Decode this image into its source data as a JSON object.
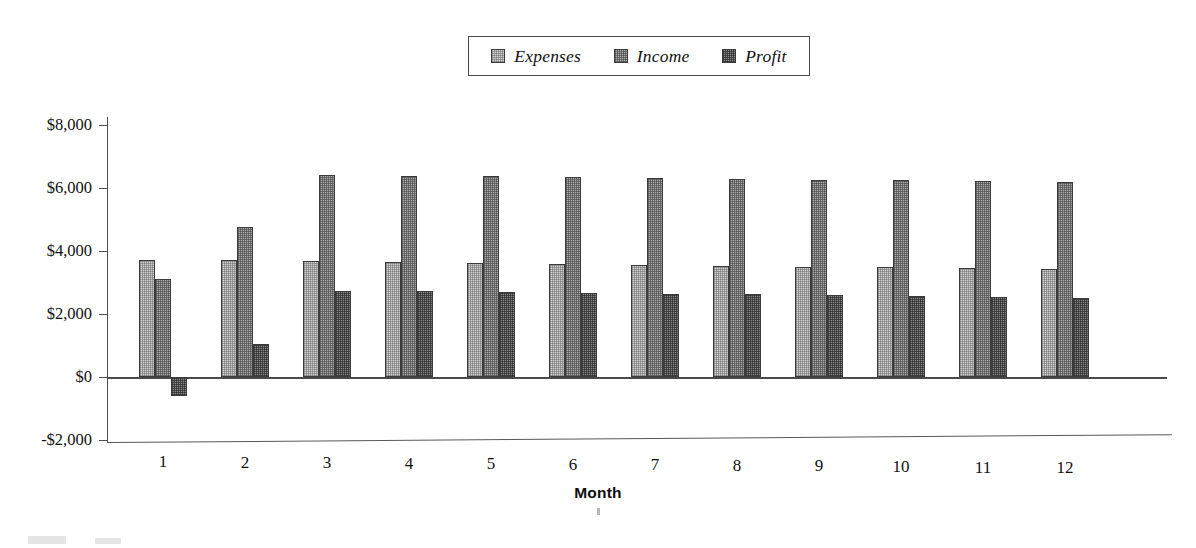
{
  "chart_data": {
    "type": "bar",
    "title": "",
    "subtitle": "",
    "xlabel": "Month",
    "ylabel": "",
    "categories": [
      "1",
      "2",
      "3",
      "4",
      "5",
      "6",
      "7",
      "8",
      "9",
      "10",
      "11",
      "12"
    ],
    "ylim": [
      -2000,
      8000
    ],
    "ytick_values": [
      8000,
      6000,
      4000,
      2000,
      0,
      -2000
    ],
    "ytick_labels": [
      "$8,000",
      "$6,000",
      "$4,000",
      "$2,000",
      "$0",
      "-$2,000"
    ],
    "grid": false,
    "legend_position": "top-center",
    "series": [
      {
        "name": "Expenses",
        "color": "#d2d2d2",
        "values": [
          3700,
          3700,
          3680,
          3640,
          3620,
          3590,
          3560,
          3530,
          3500,
          3480,
          3460,
          3440
        ]
      },
      {
        "name": "Income",
        "color": "#ababab",
        "values": [
          3100,
          4750,
          6400,
          6390,
          6370,
          6340,
          6320,
          6290,
          6260,
          6240,
          6210,
          6190
        ]
      },
      {
        "name": "Profit",
        "color": "#8a8a8a",
        "values": [
          -600,
          1050,
          2740,
          2720,
          2700,
          2670,
          2650,
          2620,
          2590,
          2570,
          2540,
          2520
        ]
      }
    ]
  },
  "legend": {
    "items": [
      {
        "label": "Expenses",
        "swatch": "legend-swatch-expenses"
      },
      {
        "label": "Income",
        "swatch": "legend-swatch-income"
      },
      {
        "label": "Profit",
        "swatch": "legend-swatch-profit"
      }
    ]
  },
  "axes": {
    "y_labels": [
      "$8,000",
      "$6,000",
      "$4,000",
      "$2,000",
      "$0",
      "-$2,000"
    ],
    "x_labels": [
      "1",
      "2",
      "3",
      "4",
      "5",
      "6",
      "7",
      "8",
      "9",
      "10",
      "11",
      "12"
    ],
    "x_title": "Month"
  }
}
